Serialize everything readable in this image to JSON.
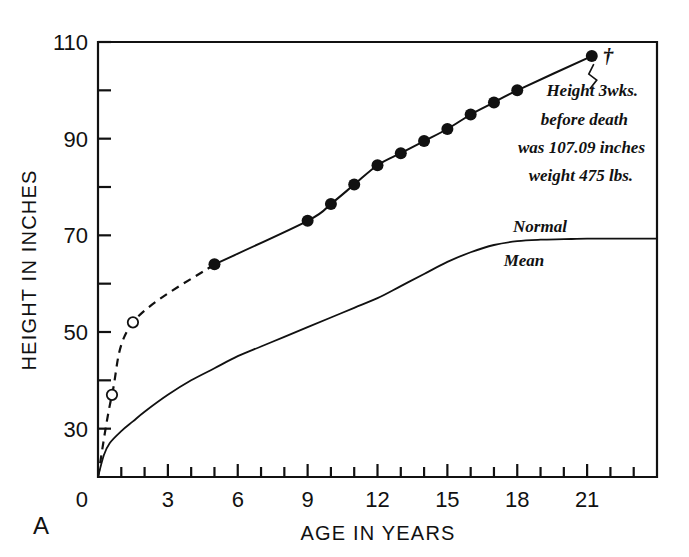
{
  "figure": {
    "panel_label": "A",
    "background_color": "#ffffff",
    "ink_color": "#111111"
  },
  "chart_data": {
    "type": "line",
    "title": "",
    "subtitle": "",
    "xlabel": "AGE IN YEARS",
    "ylabel": "HEIGHT IN INCHES",
    "xlim": [
      0,
      24
    ],
    "ylim": [
      20,
      110
    ],
    "grid": false,
    "legend_position": "inline-annotation",
    "x_ticks_major": [
      0,
      3,
      6,
      9,
      12,
      15,
      18,
      21
    ],
    "x_tick_labels": [
      "0",
      "3",
      "6",
      "9",
      "12",
      "15",
      "18",
      "21"
    ],
    "x_ticks_minor": [
      1,
      2,
      4,
      5,
      7,
      8,
      10,
      11,
      13,
      14,
      16,
      17,
      19,
      20,
      22,
      23
    ],
    "y_ticks_major": [
      30,
      50,
      70,
      90,
      110
    ],
    "y_tick_labels": [
      "30",
      "50",
      "70",
      "90",
      "110"
    ],
    "y_ticks_minor": [
      40,
      60,
      80,
      100
    ],
    "y_origin_label": "0",
    "series": [
      {
        "name": "Subject height (estimated, early)",
        "style": "dashed",
        "marker": "open-circle",
        "x": [
          0,
          0.6,
          1.5,
          5
        ],
        "y": [
          20.0,
          37.0,
          52.0,
          64.0
        ]
      },
      {
        "name": "Subject height (measured)",
        "style": "solid",
        "marker": "filled-circle",
        "x": [
          5,
          9,
          10,
          11,
          12,
          13,
          14,
          15,
          16,
          17,
          18,
          21.2
        ],
        "y": [
          64.0,
          73.0,
          76.5,
          80.5,
          84.5,
          87.0,
          89.5,
          92.0,
          95.0,
          97.5,
          100.0,
          107.09
        ]
      },
      {
        "name": "Normal Mean",
        "style": "solid",
        "marker": "none",
        "x": [
          0,
          0.25,
          0.5,
          1,
          1.5,
          2,
          3,
          4,
          5,
          6,
          7,
          8,
          9,
          10,
          11,
          12,
          13,
          14,
          15,
          16,
          17,
          18,
          19,
          20,
          21,
          22,
          23,
          24
        ],
        "y": [
          20.0,
          24.5,
          27.0,
          29.5,
          31.5,
          33.5,
          37.0,
          40.0,
          42.5,
          45.0,
          47.0,
          49.0,
          51.0,
          53.0,
          55.0,
          57.0,
          59.5,
          62.0,
          64.5,
          66.5,
          68.0,
          68.8,
          69.1,
          69.2,
          69.3,
          69.3,
          69.3,
          69.3
        ]
      }
    ],
    "annotations": [
      {
        "name": "death-marker",
        "text": "†",
        "x": 21.2,
        "y": 107.09
      },
      {
        "name": "height-note",
        "lines": [
          "Height 3wks.",
          "before death",
          "was 107.09 inches",
          "weight 475 lbs."
        ]
      },
      {
        "name": "normal-label",
        "text": "Normal"
      },
      {
        "name": "mean-label",
        "text": "Mean"
      }
    ]
  }
}
